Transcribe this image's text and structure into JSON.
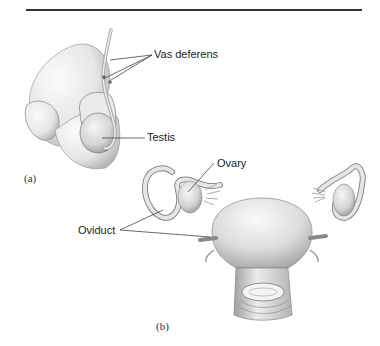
{
  "header": {
    "text": ""
  },
  "figure": {
    "panel_a": {
      "panel_label": "(a)",
      "labels": {
        "vas_deferens": "Vas deferens",
        "testis": "Testis"
      }
    },
    "panel_b": {
      "panel_label": "(b)",
      "labels": {
        "ovary": "Ovary",
        "oviduct": "Oviduct"
      }
    }
  },
  "colors": {
    "rule": "#333333",
    "label_text": "#222222",
    "leader_line": "#444444",
    "shading_dark": "#9a9a9a",
    "shading_light": "#f2f2f2"
  }
}
